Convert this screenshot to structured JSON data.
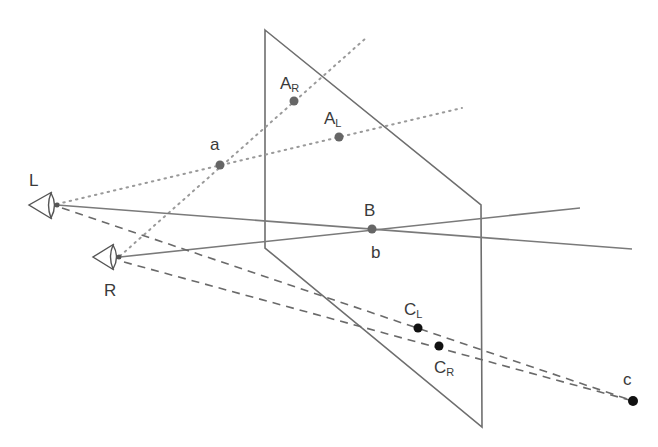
{
  "figure": {
    "type": "stereo-projection-diagram",
    "colors": {
      "line": "#6a6a6a",
      "dotted": "#9a9a9a",
      "dot_gray": "#666666",
      "dot_black": "#111111",
      "text": "#3a3a3a"
    }
  },
  "eyes": {
    "left": {
      "label": "L"
    },
    "right": {
      "label": "R"
    }
  },
  "points": {
    "AR": {
      "main": "A",
      "sub": "R"
    },
    "AL": {
      "main": "A",
      "sub": "L"
    },
    "a": {
      "label": "a"
    },
    "B": {
      "label": "B"
    },
    "b": {
      "label": "b"
    },
    "CL": {
      "main": "C",
      "sub": "L"
    },
    "CR": {
      "main": "C",
      "sub": "R"
    },
    "c": {
      "label": "c"
    }
  }
}
